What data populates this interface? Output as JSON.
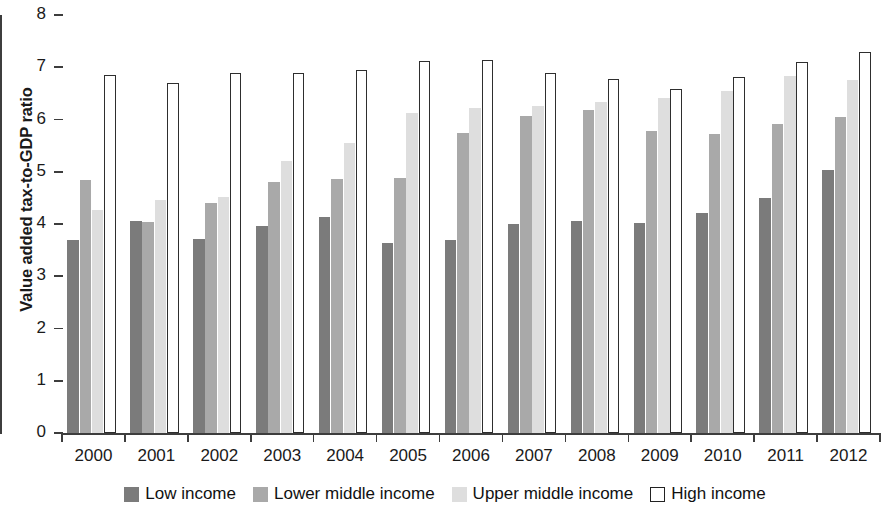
{
  "chart_data": {
    "type": "bar",
    "title": "",
    "xlabel": "",
    "ylabel": "Value added tax-to-GDP ratio",
    "ylim": [
      0,
      8
    ],
    "ytick_labels": [
      "0",
      "1",
      "2",
      "3",
      "4",
      "5",
      "6",
      "7",
      "8"
    ],
    "ytick_values": [
      0,
      1,
      2,
      3,
      4,
      5,
      6,
      7,
      8
    ],
    "grid": false,
    "legend_position": "bottom",
    "categories": [
      "2000",
      "2001",
      "2002",
      "2003",
      "2004",
      "2005",
      "2006",
      "2007",
      "2008",
      "2009",
      "2010",
      "2011",
      "2012"
    ],
    "series": [
      {
        "name": "Low income",
        "color": "#7b7b7b",
        "values": [
          3.7,
          4.06,
          3.72,
          3.97,
          4.13,
          3.64,
          3.7,
          4.0,
          4.06,
          4.01,
          4.21,
          4.49,
          5.04
        ]
      },
      {
        "name": "Lower middle income",
        "color": "#a9a9a9",
        "values": [
          4.85,
          4.04,
          4.41,
          4.8,
          4.86,
          4.89,
          5.74,
          6.06,
          6.19,
          5.78,
          5.72,
          5.91,
          6.04
        ]
      },
      {
        "name": "Upper middle income",
        "color": "#dedede",
        "values": [
          4.27,
          4.46,
          4.51,
          5.2,
          5.56,
          6.13,
          6.22,
          6.25,
          6.33,
          6.41,
          6.55,
          6.84,
          6.76
        ]
      },
      {
        "name": "High income",
        "color": "#ffffff",
        "values": [
          6.85,
          6.69,
          6.89,
          6.89,
          6.94,
          7.12,
          7.14,
          6.89,
          6.77,
          6.58,
          6.82,
          7.1,
          7.29
        ]
      }
    ]
  },
  "legend": {
    "items": [
      {
        "label": "Low income"
      },
      {
        "label": "Lower middle income"
      },
      {
        "label": "Upper middle income"
      },
      {
        "label": "High income"
      }
    ]
  }
}
